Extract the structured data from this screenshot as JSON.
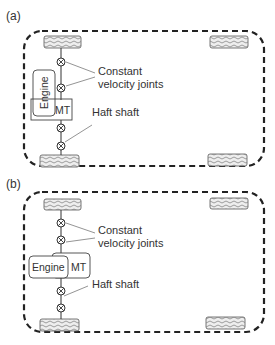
{
  "diagram": {
    "panels": [
      {
        "id": "a",
        "label": "(a)",
        "engine_label": "Engine",
        "transmission_label": "MT",
        "engine_orientation": "longitudinal",
        "annotations": {
          "cv_joints_line1": "Constant",
          "cv_joints_line2": "velocity joints",
          "half_shaft": "Haft shaft"
        }
      },
      {
        "id": "b",
        "label": "(b)",
        "engine_label": "Engine",
        "transmission_label": "MT",
        "engine_orientation": "transverse",
        "annotations": {
          "cv_joints_line1": "Constant",
          "cv_joints_line2": "velocity joints",
          "half_shaft": "Haft shaft"
        }
      }
    ],
    "colors": {
      "line": "#333333",
      "wheel_fill": "#e6e6e6",
      "background": "#ffffff"
    }
  }
}
